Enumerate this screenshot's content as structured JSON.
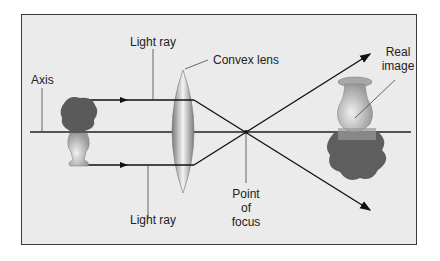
{
  "diagram": {
    "labels": {
      "light_ray_top": "Light ray",
      "light_ray_bottom": "Light ray",
      "convex_lens": "Convex lens",
      "axis": "Axis",
      "real_image_line1": "Real",
      "real_image_line2": "image",
      "focus_line1": "Point",
      "focus_line2": "of",
      "focus_line3": "focus"
    },
    "colors": {
      "background": "#ebebeb",
      "frame": "#3a3a3a",
      "line": "#111111",
      "lens": "#8a8a8a",
      "vase": "#b5b5b5",
      "flowers": "#5a5a5a"
    }
  }
}
